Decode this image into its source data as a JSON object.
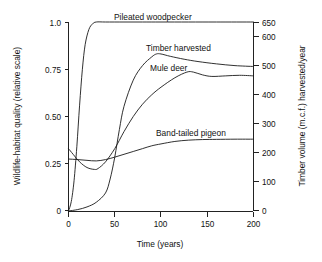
{
  "chart_data": {
    "type": "line",
    "title": "",
    "xlabel": "Time (years)",
    "ylabel": "Wildlife-habitat quality (relative scale)",
    "y2label": "Timber volume (m.c.f.) harvested/year",
    "xlim": [
      0,
      200
    ],
    "ylim": [
      0,
      1.0
    ],
    "y2lim": [
      0,
      650
    ],
    "grid": false,
    "legend_position": "inline-curve-labels",
    "xticks": [
      0,
      50,
      100,
      150,
      200
    ],
    "xticklabels": [
      "0",
      "50",
      "100",
      "150",
      "200"
    ],
    "yticks": [
      0,
      0.25,
      0.5,
      0.75,
      1.0
    ],
    "yticklabels": [
      "0",
      "0.25",
      "0.50",
      "0.75",
      "1.0"
    ],
    "y2ticks": [
      0,
      100,
      200,
      300,
      400,
      500,
      600,
      650
    ],
    "y2ticklabels": [
      "0",
      "100",
      "200",
      "300",
      "400",
      "500",
      "600",
      "650"
    ],
    "series": [
      {
        "name": "Pileated woodpecker",
        "axis": "left",
        "x": [
          0,
          3,
          6,
          9,
          12,
          15,
          18,
          22,
          26,
          30,
          40,
          60,
          80,
          100,
          130,
          160,
          200
        ],
        "values": [
          0.0,
          0.05,
          0.16,
          0.34,
          0.56,
          0.75,
          0.88,
          0.96,
          0.99,
          1.0,
          1.0,
          1.0,
          1.0,
          1.0,
          1.0,
          1.0,
          1.0
        ]
      },
      {
        "name": "Timber harvested",
        "axis": "right",
        "x": [
          0,
          10,
          20,
          30,
          40,
          45,
          50,
          55,
          60,
          70,
          80,
          90,
          95,
          100,
          110,
          125,
          140,
          160,
          180,
          200
        ],
        "values": [
          0,
          5,
          14,
          30,
          62,
          110,
          185,
          280,
          360,
          450,
          500,
          530,
          540,
          540,
          532,
          522,
          514,
          506,
          500,
          497
        ]
      },
      {
        "name": "Mule deer",
        "axis": "left",
        "x": [
          0,
          5,
          12,
          20,
          28,
          32,
          40,
          50,
          60,
          70,
          80,
          90,
          100,
          115,
          128,
          135,
          145,
          155,
          170,
          185,
          200
        ],
        "values": [
          0.33,
          0.3,
          0.26,
          0.23,
          0.22,
          0.225,
          0.26,
          0.33,
          0.42,
          0.5,
          0.565,
          0.615,
          0.655,
          0.705,
          0.735,
          0.735,
          0.72,
          0.712,
          0.715,
          0.718,
          0.715
        ]
      },
      {
        "name": "Band-tailed pigeon",
        "axis": "left",
        "x": [
          0,
          10,
          20,
          30,
          40,
          50,
          60,
          70,
          80,
          90,
          100,
          115,
          130,
          145,
          160,
          180,
          200
        ],
        "values": [
          0.275,
          0.272,
          0.268,
          0.265,
          0.272,
          0.285,
          0.3,
          0.315,
          0.33,
          0.345,
          0.355,
          0.368,
          0.375,
          0.378,
          0.379,
          0.38,
          0.38
        ]
      }
    ],
    "series_label_positions": [
      {
        "name": "Pileated woodpecker",
        "x": 114,
        "y": 20
      },
      {
        "name": "Timber harvested",
        "x": 146,
        "y": 51
      },
      {
        "name": "Mule deer",
        "x": 150,
        "y": 71
      },
      {
        "name": "Band-tailed pigeon",
        "x": 156,
        "y": 136
      }
    ]
  },
  "axes": {
    "left": {
      "title": "Wildlife-habitat quality (relative scale)",
      "ticklabels": [
        "1.0",
        "0.75",
        "0.50",
        "0.25",
        "0"
      ]
    },
    "right": {
      "title": "Timber volume (m.c.f.) harvested/year",
      "ticklabels": [
        "650",
        "600",
        "500",
        "400",
        "300",
        "200",
        "100",
        "0"
      ]
    },
    "bottom": {
      "title": "Time (years)",
      "ticklabels": [
        "0",
        "50",
        "100",
        "150",
        "200"
      ]
    }
  },
  "colors": {
    "background": "#ffffff",
    "axis": "#222222",
    "curve": "#1a1a1a",
    "text": "#111111"
  }
}
